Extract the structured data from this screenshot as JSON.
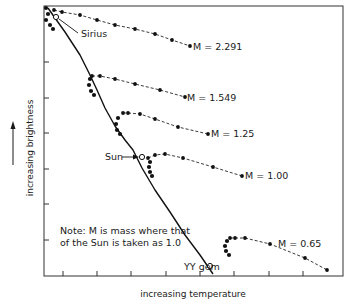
{
  "chart_data": {
    "type": "line",
    "title": "",
    "xlabel": "increasing temperature",
    "ylabel": "increasing brightness",
    "x_direction": "temperature increases to the left (H-R diagram)",
    "grid": false,
    "note": "Note: M is mass where that of the Sun is taken as 1.0",
    "frame": {
      "left": 44,
      "top": 6,
      "right": 343,
      "bottom": 276
    },
    "x_ticks_px": [
      63,
      97,
      131,
      166,
      200,
      234,
      269,
      303
    ],
    "y_ticks_px": [
      62,
      98,
      133,
      169,
      204,
      240
    ],
    "main_sequence": {
      "name": "zero-age main sequence",
      "points_px": [
        [
          48,
          8
        ],
        [
          55,
          18
        ],
        [
          65,
          32
        ],
        [
          80,
          55
        ],
        [
          90,
          75
        ],
        [
          97,
          90
        ],
        [
          105,
          108
        ],
        [
          115,
          126
        ],
        [
          125,
          140
        ],
        [
          133,
          150
        ],
        [
          142,
          168
        ],
        [
          155,
          190
        ],
        [
          170,
          212
        ],
        [
          185,
          235
        ],
        [
          200,
          255
        ],
        [
          213,
          274
        ]
      ]
    },
    "series": [
      {
        "name": "M = 2.291",
        "label": "M = 2.291",
        "track_px": [
          [
            54,
            10
          ],
          [
            62,
            12
          ],
          [
            80,
            15
          ],
          [
            97,
            20
          ],
          [
            115,
            25
          ],
          [
            135,
            29
          ],
          [
            155,
            34
          ],
          [
            172,
            40
          ],
          [
            190,
            46
          ]
        ],
        "loop_px": [
          [
            46,
            8
          ],
          [
            48,
            14
          ],
          [
            46,
            20
          ],
          [
            50,
            25
          ],
          [
            53,
            29
          ]
        ]
      },
      {
        "name": "M = 1.549",
        "label": "M = 1.549",
        "track_px": [
          [
            92,
            76
          ],
          [
            100,
            76
          ],
          [
            115,
            79
          ],
          [
            135,
            84
          ],
          [
            160,
            90
          ],
          [
            185,
            97
          ]
        ],
        "loop_px": [
          [
            90,
            79
          ],
          [
            89,
            85
          ],
          [
            91,
            91
          ],
          [
            94,
            95
          ]
        ]
      },
      {
        "name": "M = 1.25",
        "label": "M = 1.25",
        "track_px": [
          [
            123,
            113
          ],
          [
            128,
            113
          ],
          [
            140,
            114
          ],
          [
            155,
            119
          ],
          [
            178,
            127
          ],
          [
            208,
            134
          ]
        ],
        "loop_px": [
          [
            118,
            118
          ],
          [
            116,
            124
          ],
          [
            117,
            130
          ],
          [
            120,
            134
          ]
        ]
      },
      {
        "name": "M = 1.00",
        "label": "M = 1.00",
        "track_px": [
          [
            148,
            158
          ],
          [
            155,
            155
          ],
          [
            165,
            154
          ],
          [
            183,
            158
          ],
          [
            213,
            167
          ],
          [
            242,
            176
          ]
        ],
        "loop_px": [
          [
            150,
            162
          ],
          [
            149,
            167
          ],
          [
            150,
            172
          ],
          [
            152,
            176
          ]
        ]
      },
      {
        "name": "M = 0.65",
        "label": "M = 0.65",
        "track_px": [
          [
            230,
            238
          ],
          [
            235,
            238
          ],
          [
            245,
            238
          ],
          [
            270,
            244
          ],
          [
            305,
            258
          ],
          [
            327,
            270
          ]
        ],
        "loop_px": [
          [
            227,
            241
          ],
          [
            225,
            246
          ],
          [
            226,
            251
          ],
          [
            229,
            255
          ]
        ]
      }
    ],
    "annotations": [
      {
        "text": "Sirius",
        "x": 80,
        "y": 36,
        "pointer_to": [
          56,
          17
        ]
      },
      {
        "text": "Sun",
        "x": 105,
        "y": 160,
        "pointer_to": [
          142,
          157
        ],
        "arrow": true
      },
      {
        "text": "YY gem",
        "x": 186,
        "y": 269,
        "pointer_to": [
          210,
          266
        ]
      }
    ],
    "open_markers_px": [
      [
        56,
        17
      ],
      [
        142,
        157
      ],
      [
        210,
        266
      ]
    ]
  },
  "axes": {
    "ylabel": "increasing brightness",
    "xlabel": "increasing temperature"
  },
  "note": {
    "line1": "Note: M is mass where that",
    "line2": "of the Sun is taken as 1.0"
  },
  "labels": {
    "sirius": "Sirius",
    "sun": "Sun",
    "yy_gem": "YY gem",
    "m2291": "M = 2.291",
    "m1549": "M = 1.549",
    "m125": "M = 1.25",
    "m100": "M = 1.00",
    "m065": "M = 0.65"
  },
  "colors": {
    "ink": "#1a1a1a",
    "background": "#ffffff"
  }
}
